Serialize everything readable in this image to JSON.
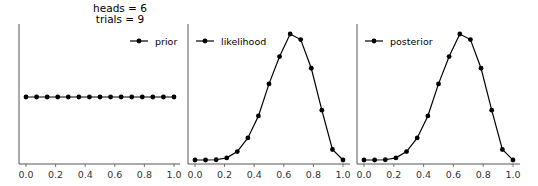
{
  "title": {
    "line1": "heads = 6",
    "line2": "trials = 9"
  },
  "chart_data": [
    {
      "type": "line",
      "panel": "prior",
      "title": "",
      "legend": [
        "prior"
      ],
      "legend_position": "upper right",
      "x": [
        0.0,
        0.0714,
        0.1429,
        0.2143,
        0.2857,
        0.3571,
        0.4286,
        0.5,
        0.5714,
        0.6429,
        0.7143,
        0.7857,
        0.8571,
        0.9286,
        1.0
      ],
      "series": [
        {
          "name": "prior",
          "values": [
            1,
            1,
            1,
            1,
            1,
            1,
            1,
            1,
            1,
            1,
            1,
            1,
            1,
            1,
            1
          ]
        }
      ],
      "xticks": [
        "0.0",
        "0.2",
        "0.4",
        "0.6",
        "0.8",
        "1.0"
      ],
      "xlim": [
        0,
        1
      ],
      "yticks": [],
      "grid": false
    },
    {
      "type": "line",
      "panel": "likelihood",
      "title": "",
      "legend": [
        "likelihood"
      ],
      "legend_position": "upper left",
      "x": [
        0.0,
        0.0714,
        0.1429,
        0.2143,
        0.2857,
        0.3571,
        0.4286,
        0.5,
        0.5714,
        0.6429,
        0.7143,
        0.7857,
        0.8571,
        0.9286,
        1.0
      ],
      "series": [
        {
          "name": "likelihood",
          "values": [
            0.0,
            1e-05,
            0.00053,
            0.00458,
            0.01823,
            0.04768,
            0.09494,
            0.1641,
            0.2231,
            0.2717,
            0.2597,
            0.1978,
            0.1074,
            0.0226,
            0.0
          ]
        }
      ],
      "xticks": [
        "0.0",
        "0.2",
        "0.4",
        "0.6",
        "0.8",
        "1.0"
      ],
      "xlim": [
        0,
        1
      ],
      "yticks": [],
      "grid": false
    },
    {
      "type": "line",
      "panel": "posterior",
      "title": "",
      "legend": [
        "posterior"
      ],
      "legend_position": "upper left",
      "x": [
        0.0,
        0.0714,
        0.1429,
        0.2143,
        0.2857,
        0.3571,
        0.4286,
        0.5,
        0.5714,
        0.6429,
        0.7143,
        0.7857,
        0.8571,
        0.9286,
        1.0
      ],
      "series": [
        {
          "name": "posterior",
          "values": [
            0.0,
            1e-05,
            0.00053,
            0.00458,
            0.01823,
            0.04768,
            0.09494,
            0.1641,
            0.2231,
            0.2717,
            0.2597,
            0.1978,
            0.1074,
            0.0226,
            0.0
          ]
        }
      ],
      "xticks": [
        "0.0",
        "0.2",
        "0.4",
        "0.6",
        "0.8",
        "1.0"
      ],
      "xlim": [
        0,
        1
      ],
      "yticks": [],
      "grid": false
    }
  ]
}
